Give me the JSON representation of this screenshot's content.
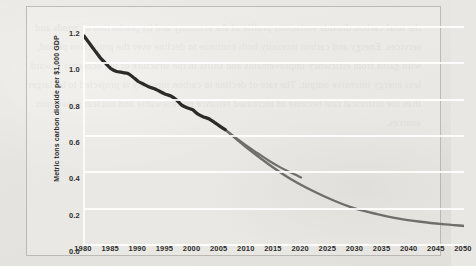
{
  "chart_data": {
    "type": "line",
    "title": "",
    "xlabel": "",
    "ylabel": "Metric tons carbon dioxide per $1,000 GDP",
    "xlim": [
      1980,
      2050
    ],
    "ylim": [
      0.0,
      1.2
    ],
    "grid": true,
    "legend": "none",
    "xticks": [
      "1980",
      "1985",
      "1990",
      "1995",
      "2000",
      "2005",
      "2010",
      "2015",
      "2020",
      "2025",
      "2030",
      "2035",
      "2040",
      "2045",
      "2050"
    ],
    "yticks": [
      "0.0",
      "0.2",
      "0.4",
      "0.6",
      "0.8",
      "1.0",
      "1.2"
    ],
    "series": [
      {
        "name": "history",
        "color": "#2b2b29",
        "x": [
          1980,
          1981,
          1982,
          1983,
          1984,
          1985,
          1986,
          1987,
          1988,
          1989,
          1990,
          1991,
          1992,
          1993,
          1994,
          1995,
          1996,
          1997,
          1998,
          1999,
          2000,
          2001,
          2002,
          2003,
          2004,
          2005,
          2006
        ],
        "values": [
          1.15,
          1.11,
          1.07,
          1.03,
          1.0,
          0.97,
          0.955,
          0.95,
          0.945,
          0.925,
          0.9,
          0.885,
          0.87,
          0.86,
          0.845,
          0.83,
          0.82,
          0.8,
          0.77,
          0.755,
          0.745,
          0.72,
          0.705,
          0.695,
          0.675,
          0.655,
          0.635
        ]
      },
      {
        "name": "projection-high",
        "color": "#6f6e6a",
        "x": [
          2006,
          2008,
          2010,
          2012,
          2014,
          2016,
          2018,
          2020
        ],
        "values": [
          0.635,
          0.59,
          0.545,
          0.505,
          0.465,
          0.43,
          0.4,
          0.372
        ]
      },
      {
        "name": "projection-low",
        "color": "#6f6e6a",
        "x": [
          2006,
          2010,
          2014,
          2018,
          2022,
          2026,
          2030,
          2034,
          2038,
          2042,
          2046,
          2050
        ],
        "values": [
          0.635,
          0.535,
          0.445,
          0.365,
          0.3,
          0.245,
          0.2,
          0.17,
          0.145,
          0.128,
          0.115,
          0.105
        ]
      }
    ]
  },
  "bleedthrough": {
    "text": "the total carbon dioxide emissions profile of the economy and its production of goods and services. Energy and carbon intensity both continue to decline over the projection period, with gains from efficiency improvements and shifts in the structure of the economy toward less energy intensive output. The rate of decline in carbon intensity is projected to be larger than the historical rate because of increased reliance on renewable and nuclear generation sources."
  }
}
